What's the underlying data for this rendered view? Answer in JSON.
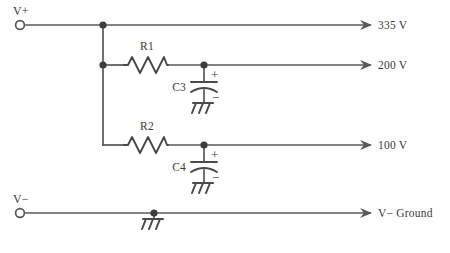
{
  "diagram": {
    "type": "schematic",
    "colors": {
      "background": "#ffffff",
      "wire": "#58585a",
      "component": "#4a4a4c",
      "node": "#3d3d3f",
      "text": "#3a3a3c"
    }
  },
  "terminals": [
    {
      "id": "v-plus",
      "label": "V+",
      "shape": "open-circle",
      "x": 18,
      "y": 27
    },
    {
      "id": "v-minus",
      "label": "V−",
      "shape": "open-circle",
      "x": 18,
      "y": 213
    }
  ],
  "rails": [
    {
      "id": "rail-335",
      "label": "335 V",
      "y": 25,
      "arrow_x": 370,
      "text_x": 378
    },
    {
      "id": "rail-200",
      "label": "200 V",
      "y": 65,
      "arrow_x": 370,
      "text_x": 378
    },
    {
      "id": "rail-100",
      "label": "100 V",
      "y": 145,
      "arrow_x": 370,
      "text_x": 378
    },
    {
      "id": "rail-gnd",
      "label": "V− Ground",
      "y": 213,
      "arrow_x": 370,
      "text_x": 378
    }
  ],
  "resistors": [
    {
      "id": "r1",
      "label": "R1",
      "label_x": 147,
      "label_y": 50,
      "x": 124,
      "y": 65,
      "width": 44
    },
    {
      "id": "r2",
      "label": "R2",
      "label_x": 147,
      "label_y": 130,
      "x": 124,
      "y": 145,
      "width": 44
    }
  ],
  "capacitors": [
    {
      "id": "c3",
      "label": "C3",
      "plus": "+",
      "minus": "−",
      "x": 204,
      "top_y": 65,
      "plate_y": 86,
      "label_x": 182,
      "label_y": 90,
      "plus_x": 211,
      "plus_y": 78,
      "minus_x": 212,
      "minus_y": 101
    },
    {
      "id": "c4",
      "label": "C4",
      "plus": "+",
      "minus": "−",
      "x": 204,
      "top_y": 145,
      "plate_y": 166,
      "label_x": 182,
      "label_y": 170,
      "plus_x": 211,
      "plus_y": 158,
      "minus_x": 212,
      "minus_y": 181
    }
  ],
  "grounds": [
    {
      "id": "gnd-c3",
      "x": 204,
      "y": 103,
      "style": "chassis"
    },
    {
      "id": "gnd-c4",
      "x": 204,
      "y": 183,
      "style": "chassis"
    },
    {
      "id": "gnd-rail",
      "x": 154,
      "y": 219,
      "style": "chassis"
    }
  ],
  "nodes": [
    {
      "id": "node-335-bus",
      "x": 103,
      "y": 25
    },
    {
      "id": "node-200-bus",
      "x": 103,
      "y": 65
    },
    {
      "id": "node-c3-tap",
      "x": 204,
      "y": 65
    },
    {
      "id": "node-c4-tap",
      "x": 204,
      "y": 145
    },
    {
      "id": "node-gnd-tap",
      "x": 154,
      "y": 213
    }
  ],
  "wires": {
    "vplus_to_rail": "M 26 25 L 370 25",
    "left_bus": "M 103 25 L 103 145",
    "r1_left_lead": "M 103 65 L 124 65",
    "r1_right_lead": "M 168 65 L 370 65",
    "r2_left_lead": "M 103 145 L 124 145",
    "r2_right_lead": "M 168 145 L 370 145",
    "vminus_to_rail": "M 26 213 L 370 213"
  }
}
